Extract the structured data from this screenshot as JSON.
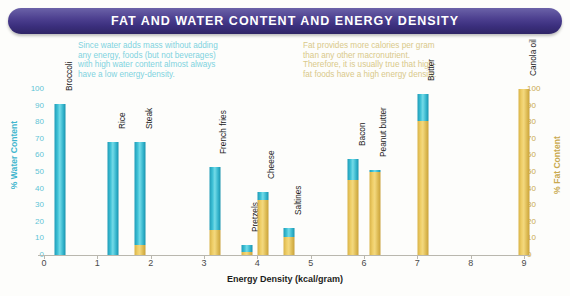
{
  "title": "FAT AND WATER CONTENT AND ENERGY DENSITY",
  "annotations": {
    "water": "Since water adds mass without adding\nany energy, foods (but not beverages)\nwith high water content almost always\nhave a low energy-density.",
    "fat": "Fat provides more calories per gram\nthan any other macronutrient.\nTherefore, it is usually true that high-\nfat foods have a high energy density."
  },
  "colors": {
    "water": "#3fc1d6",
    "fat": "#f0d06a",
    "title_bar": "#4c3f8f",
    "water_text": "#7fd3e0",
    "fat_text": "#d9c98a"
  },
  "chart_data": {
    "type": "bar",
    "title": "FAT AND WATER CONTENT AND ENERGY DENSITY",
    "xlabel": "Energy Density (kcal/gram)",
    "ylabel": "% Water Content",
    "y2label": "% Fat Content",
    "xlim": [
      0,
      9
    ],
    "ylim": [
      0,
      100
    ],
    "y2lim": [
      0,
      100
    ],
    "grid": false,
    "legend": "none",
    "xticks": [
      "0",
      "1",
      "2",
      "3",
      "4",
      "5",
      "6",
      "7",
      "8",
      "9"
    ],
    "yticks": [
      "0",
      "10",
      "20",
      "30",
      "40",
      "50",
      "60",
      "70",
      "80",
      "90",
      "100"
    ],
    "y2ticks": [
      "0",
      "10",
      "20",
      "30",
      "40",
      "50",
      "60",
      "70",
      "80",
      "90",
      "100"
    ],
    "stacked": true,
    "series": [
      {
        "name": "% Fat Content",
        "axis": "right",
        "values": [
          0,
          0,
          6,
          15,
          33,
          11,
          45,
          50,
          81,
          100
        ]
      },
      {
        "name": "% Water Content",
        "axis": "left",
        "values": [
          91,
          68,
          62,
          38,
          4,
          5,
          13,
          1,
          16,
          0
        ]
      }
    ],
    "points": [
      {
        "label": "Broccoli",
        "energy_density": 0.3,
        "water": 91,
        "fat": 0
      },
      {
        "label": "Rice",
        "energy_density": 1.3,
        "water": 68,
        "fat": 0
      },
      {
        "label": "Steak",
        "energy_density": 1.8,
        "water": 62,
        "fat": 6
      },
      {
        "label": "French fries",
        "energy_density": 3.2,
        "water": 38,
        "fat": 15
      },
      {
        "label": "Pretzels",
        "energy_density": 3.8,
        "water": 4,
        "fat": 2
      },
      {
        "label": "Cheese",
        "energy_density": 4.1,
        "water": 5,
        "fat": 33
      },
      {
        "label": "Saltines",
        "energy_density": 4.6,
        "water": 5,
        "fat": 11
      },
      {
        "label": "Bacon",
        "energy_density": 5.8,
        "water": 13,
        "fat": 45
      },
      {
        "label": "Peanut butter",
        "energy_density": 6.2,
        "water": 1,
        "fat": 50
      },
      {
        "label": "Butter",
        "energy_density": 7.1,
        "water": 16,
        "fat": 81
      },
      {
        "label": "Canola oil",
        "energy_density": 9.0,
        "water": 0,
        "fat": 100
      }
    ]
  }
}
